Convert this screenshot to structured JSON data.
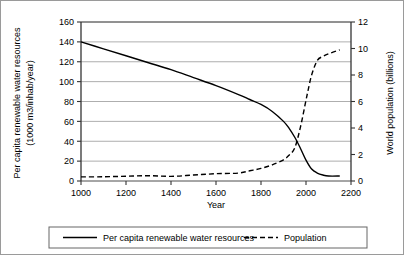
{
  "chart_data": {
    "type": "line",
    "title": "",
    "xlabel": "Year",
    "ylabel": "Per capita renewable water resources (1000 m3/inhab/year)",
    "y2label": "World population (billions)",
    "xlim": [
      1000,
      2200
    ],
    "ylim": [
      0,
      160
    ],
    "y2lim": [
      0,
      12
    ],
    "xticks": [
      1000,
      1200,
      1400,
      1600,
      1800,
      2000,
      2200
    ],
    "xticklabels": [
      "1000",
      "1200",
      "1400",
      "1600",
      "1800",
      "2000",
      "2200"
    ],
    "yticks": [
      0,
      20,
      40,
      60,
      80,
      100,
      120,
      140,
      160
    ],
    "yticklabels": [
      "0",
      "20",
      "40",
      "60",
      "80",
      "100",
      "120",
      "140",
      "160"
    ],
    "y2ticks": [
      0,
      2,
      4,
      6,
      8,
      10,
      12
    ],
    "y2ticklabels": [
      "0",
      "2",
      "4",
      "6",
      "8",
      "10",
      "12"
    ],
    "grid": "horizontal",
    "legend_position": "bottom-outside",
    "series": [
      {
        "name": "Per capita renewable water resources",
        "axis": "left",
        "style": "solid",
        "color": "#000000",
        "x": [
          1000,
          1100,
          1200,
          1300,
          1400,
          1500,
          1600,
          1700,
          1750,
          1800,
          1850,
          1900,
          1925,
          1950,
          1975,
          2000,
          2025,
          2050,
          2075,
          2100,
          2150
        ],
        "y": [
          140,
          133,
          126,
          119,
          112,
          104,
          96,
          87,
          82,
          77,
          70,
          60,
          53,
          44,
          33,
          21,
          12,
          8,
          6,
          5,
          5
        ]
      },
      {
        "name": "Population",
        "axis": "right",
        "style": "dashed",
        "color": "#000000",
        "x": [
          1000,
          1100,
          1200,
          1300,
          1400,
          1500,
          1600,
          1700,
          1750,
          1800,
          1850,
          1900,
          1925,
          1950,
          1975,
          2000,
          2010,
          2025,
          2050,
          2075,
          2100,
          2150
        ],
        "y": [
          0.31,
          0.32,
          0.36,
          0.4,
          0.35,
          0.45,
          0.55,
          0.6,
          0.77,
          0.95,
          1.22,
          1.6,
          1.95,
          2.5,
          4.05,
          6.1,
          6.9,
          8.0,
          9.1,
          9.4,
          9.6,
          9.9
        ]
      }
    ],
    "legend": [
      {
        "label": "Per capita renewable water resources",
        "style": "solid"
      },
      {
        "label": "Population",
        "style": "dashed"
      }
    ]
  },
  "axes": {
    "left_title_line1": "Per capita renewable water resources",
    "left_title_line2": "(1000 m3/inhab/year)",
    "right_title": "World population (billions)",
    "x_title": "Year"
  }
}
